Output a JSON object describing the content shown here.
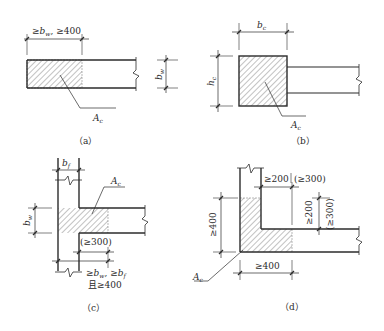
{
  "figure": {
    "panels": [
      {
        "id": "a",
        "caption": "（a）",
        "dim_top": "≥bw, ≥400",
        "dim_top_parts": {
          "sym1": "≥",
          "b": "b",
          "sub_w": "w",
          "rest": ", ≥400"
        },
        "dim_right": "bw",
        "area_label": "Ac"
      },
      {
        "id": "b",
        "caption": "（b）",
        "dim_top": "bc",
        "dim_left": "hc",
        "area_label": "Ac"
      },
      {
        "id": "c",
        "caption": "（c）",
        "dim_top": "bf",
        "dim_left": "bw",
        "area_label": "Ac",
        "dim_inner": "(≥300)",
        "dim_bottom_line1": "≥bw, ≥bf",
        "dim_bottom_line2": "且≥400"
      },
      {
        "id": "d",
        "caption": "（d）",
        "dim_top": "≥200",
        "dim_top_alt": "(≥300)",
        "dim_right": "≥200",
        "dim_right_alt": "(≥300)",
        "dim_left": "≥400",
        "dim_bottom": "≥400",
        "area_label": "Ac"
      }
    ],
    "colors": {
      "line": "#2b2b2b",
      "hatch": "#555555",
      "text": "#2a2a2a",
      "background": "#ffffff"
    }
  }
}
